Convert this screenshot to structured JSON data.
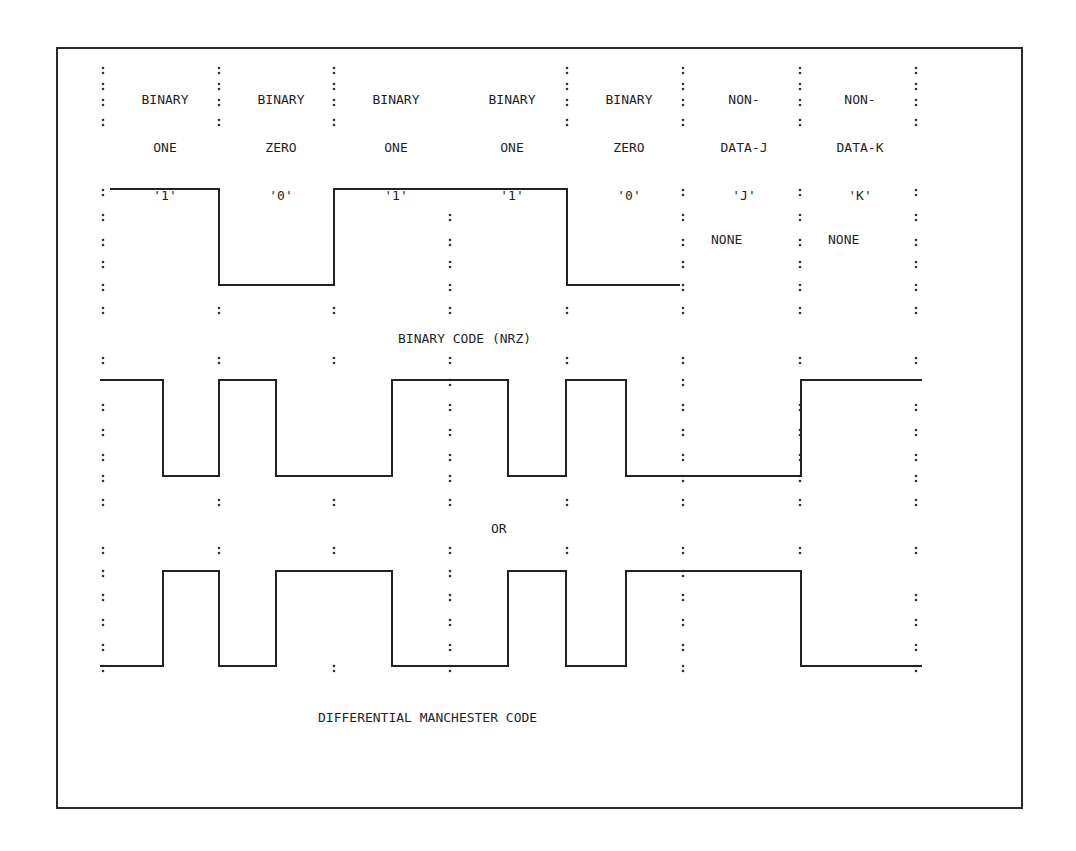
{
  "columns": [
    {
      "line1": "BINARY",
      "line2": "ONE",
      "line3": "'1'"
    },
    {
      "line1": "BINARY",
      "line2": "ZERO",
      "line3": "'0'"
    },
    {
      "line1": "BINARY",
      "line2": "ONE",
      "line3": "'1'"
    },
    {
      "line1": "BINARY",
      "line2": "ONE",
      "line3": "'1'"
    },
    {
      "line1": "BINARY",
      "line2": "ZERO",
      "line3": "'0'"
    },
    {
      "line1": "NON-",
      "line2": "DATA-J",
      "line3": "'J'"
    },
    {
      "line1": "NON-",
      "line2": "DATA-K",
      "line3": "'K'"
    }
  ],
  "nrz": {
    "none_j": "NONE",
    "none_k": "NONE",
    "label": "BINARY CODE (NRZ)"
  },
  "separator_label": "OR",
  "manchester": {
    "label": "DIFFERENTIAL MANCHESTER CODE"
  },
  "chart_data": {
    "type": "line",
    "categories": [
      "BINARY ONE '1'",
      "BINARY ZERO '0'",
      "BINARY ONE '1'",
      "BINARY ONE '1'",
      "BINARY ZERO '0'",
      "NON-DATA-J 'J'",
      "NON-DATA-K 'K'"
    ],
    "series": [
      {
        "name": "BINARY CODE (NRZ)",
        "levels_per_bit": [
          1,
          0,
          1,
          1,
          0,
          null,
          null
        ],
        "note": "NONE for J and K"
      },
      {
        "name": "DIFFERENTIAL MANCHESTER CODE (variant A)",
        "half_bit_levels": [
          [
            1,
            0
          ],
          [
            1,
            0
          ],
          [
            0,
            1
          ],
          [
            1,
            0
          ],
          [
            1,
            0
          ],
          [
            0,
            0
          ],
          [
            1,
            1
          ]
        ]
      },
      {
        "name": "DIFFERENTIAL MANCHESTER CODE (variant B)",
        "half_bit_levels": [
          [
            0,
            1
          ],
          [
            0,
            1
          ],
          [
            1,
            0
          ],
          [
            0,
            1
          ],
          [
            0,
            1
          ],
          [
            1,
            1
          ],
          [
            0,
            0
          ]
        ]
      }
    ],
    "annotations": [
      "OR"
    ]
  }
}
